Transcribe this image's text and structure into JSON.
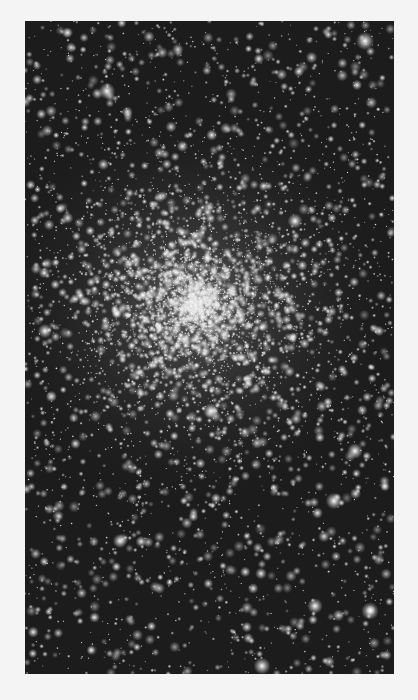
{
  "image": {
    "subject": "globular star cluster",
    "frame": {
      "x": 25,
      "y": 21,
      "width": 369,
      "height": 653
    },
    "core_center": {
      "x": 170,
      "y": 284
    },
    "colors": {
      "page_bg": "#f4f4f4",
      "sky_bg": "#1c1c1c",
      "star": "#ffffff"
    }
  }
}
